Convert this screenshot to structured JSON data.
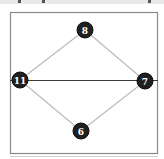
{
  "diagram": {
    "type": "graph",
    "nodes": [
      {
        "id": "n8",
        "label": "8"
      },
      {
        "id": "n11",
        "label": "11"
      },
      {
        "id": "n7",
        "label": "7"
      },
      {
        "id": "n6",
        "label": "6"
      }
    ],
    "edges": [
      {
        "from": "n8",
        "to": "n11",
        "style": "light"
      },
      {
        "from": "n8",
        "to": "n7",
        "style": "light"
      },
      {
        "from": "n11",
        "to": "n6",
        "style": "light"
      },
      {
        "from": "n7",
        "to": "n6",
        "style": "light"
      },
      {
        "from": "n11",
        "to": "n7",
        "style": "dark"
      }
    ],
    "colors": {
      "node_fill": "#1f1f1f",
      "node_text": "#ffffff",
      "light_edge": "#b9b9b9",
      "dark_edge": "#3c3c3c",
      "frame": "#8a8a8a"
    }
  }
}
